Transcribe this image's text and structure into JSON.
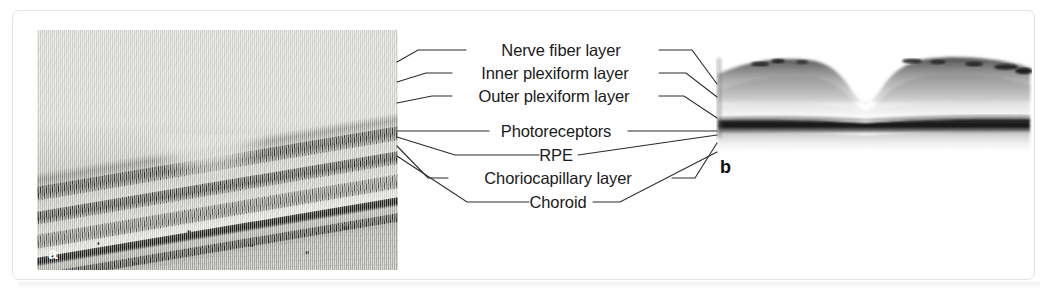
{
  "figure": {
    "caption_labels": {
      "panel_a": "a",
      "panel_b": "b"
    },
    "panel_a_description": "Histologic cross-section micrograph of the macula showing the retinal layers",
    "panel_b_description": "Optical coherence tomography (OCT) B-scan of the macula showing the foveal depression"
  },
  "annotations": [
    {
      "id": "nerve-fiber-layer",
      "label": "Nerve fiber layer",
      "cx": 561,
      "cy": 50
    },
    {
      "id": "inner-plexiform-layer",
      "label": "Inner plexiform layer",
      "cx": 555,
      "cy": 73
    },
    {
      "id": "outer-plexiform-layer",
      "label": "Outer plexiform layer",
      "cx": 554,
      "cy": 96
    },
    {
      "id": "photoreceptors",
      "label": "Photoreceptors",
      "cx": 556,
      "cy": 131
    },
    {
      "id": "rpe",
      "label": "RPE",
      "cx": 556,
      "cy": 155
    },
    {
      "id": "choriocapillary-layer",
      "label": "Choriocapillary layer",
      "cx": 558,
      "cy": 178
    },
    {
      "id": "choroid",
      "label": "Choroid",
      "cx": 558,
      "cy": 202
    }
  ],
  "colors": {
    "frame_border": "#e4e4e6",
    "text": "#1a1a1a",
    "leader_line": "#2b2b2b",
    "panel_a_label_text": "#ffffff",
    "panel_b_label_text": "#0d0d0d",
    "background": "#ffffff"
  }
}
